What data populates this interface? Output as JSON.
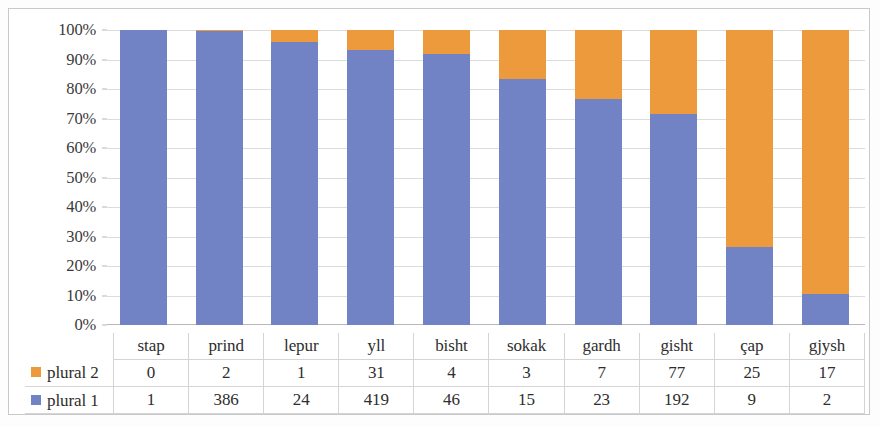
{
  "chart_data": {
    "type": "bar",
    "subtype": "100% stacked column with data table",
    "title": "",
    "xlabel": "",
    "ylabel": "",
    "ylim": [
      0,
      100
    ],
    "y_tick_labels": [
      "100%",
      "90%",
      "80%",
      "70%",
      "60%",
      "50%",
      "40%",
      "30%",
      "20%",
      "10%",
      "0%"
    ],
    "y_tick_values": [
      100,
      90,
      80,
      70,
      60,
      50,
      40,
      30,
      20,
      10,
      0
    ],
    "grid": true,
    "legend_position": "data-table-row-labels",
    "categories": [
      "stap",
      "prind",
      "lepur",
      "yll",
      "bisht",
      "sokak",
      "gardh",
      "gisht",
      "çap",
      "gjysh"
    ],
    "series": [
      {
        "name": "plural 2",
        "color": "#ed9a3c",
        "values": [
          0,
          2,
          1,
          31,
          4,
          3,
          7,
          77,
          25,
          17
        ],
        "percent": [
          0.0,
          0.5,
          4.0,
          6.9,
          8.0,
          16.7,
          23.3,
          28.6,
          73.5,
          89.5
        ]
      },
      {
        "name": "plural 1",
        "color": "#7183c4",
        "values": [
          1,
          386,
          24,
          419,
          46,
          15,
          23,
          192,
          9,
          2
        ],
        "percent": [
          100.0,
          99.5,
          96.0,
          93.1,
          92.0,
          83.3,
          76.7,
          71.4,
          26.5,
          10.5
        ]
      }
    ],
    "stack_order_bottom_to_top": [
      "plural 1",
      "plural 2"
    ]
  },
  "table": {
    "header_row_left_label": "",
    "column_headers": [
      "stap",
      "prind",
      "lepur",
      "yll",
      "bisht",
      "sokak",
      "gardh",
      "gisht",
      "çap",
      "gjysh"
    ],
    "rows": [
      {
        "label": "plural 2",
        "swatch_color": "#ed9a3c",
        "swatch_icon": "legend-square-orange-icon",
        "cells": [
          "0",
          "2",
          "1",
          "31",
          "4",
          "3",
          "7",
          "77",
          "25",
          "17"
        ]
      },
      {
        "label": "plural 1",
        "swatch_color": "#7183c4",
        "swatch_icon": "legend-square-blue-icon",
        "cells": [
          "1",
          "386",
          "24",
          "419",
          "46",
          "15",
          "23",
          "192",
          "9",
          "2"
        ]
      }
    ]
  },
  "colors": {
    "plural_1_blue": "#7183c4",
    "plural_2_orange": "#ed9a3c",
    "gridline": "#dcdcdc",
    "axis": "#b8b8b8",
    "table_border": "#d4d4d4",
    "text": "#2e2e2e",
    "frame": "#c9c9c9"
  }
}
